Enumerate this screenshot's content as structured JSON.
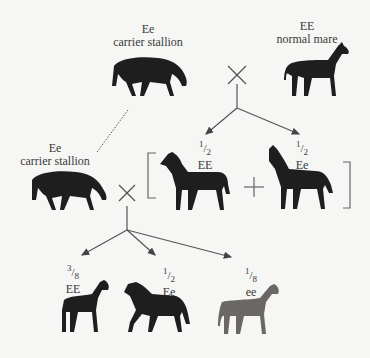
{
  "generation1": {
    "stallion": {
      "genotype": "Ee",
      "description": "carrier stallion"
    },
    "mare": {
      "genotype": "EE",
      "description": "normal mare"
    },
    "cross_symbol": "×"
  },
  "generation2": {
    "offspring": [
      {
        "fraction_num": "1",
        "fraction_den": "2",
        "genotype": "EE"
      },
      {
        "fraction_num": "1",
        "fraction_den": "2",
        "genotype": "Ee"
      }
    ],
    "plus_symbol": "+"
  },
  "backcross": {
    "stallion": {
      "genotype": "Ee",
      "description": "carrier stallion"
    },
    "cross_symbol": "×"
  },
  "generation3": {
    "offspring": [
      {
        "fraction_num": "3",
        "fraction_den": "8",
        "genotype": "EE"
      },
      {
        "fraction_num": "1",
        "fraction_den": "2",
        "genotype": "Ee"
      },
      {
        "fraction_num": "1",
        "fraction_den": "8",
        "genotype": "ee"
      }
    ]
  },
  "colors": {
    "horse_dark": "#1e1e1e",
    "horse_light": "#6b6767",
    "line": "#555555",
    "background": "#f6f6f4"
  }
}
